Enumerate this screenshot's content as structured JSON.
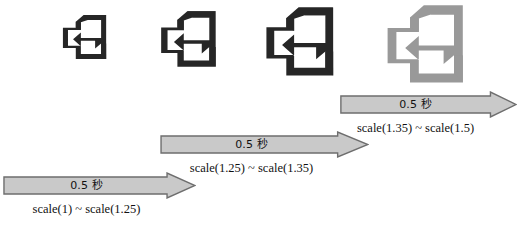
{
  "diagram": {
    "background_color": "#ffffff",
    "icon_color_default": "#262626",
    "icon_color_highlight": "#999999",
    "arrow_fill_color": "#c9c9c9",
    "arrow_stroke_color": "#6e6e6e",
    "text_color": "#111111"
  },
  "icons": [
    {
      "name": "exit-icon-step-1",
      "label": "exit-icon",
      "scale": "scale(1)",
      "color": "#262626",
      "x": 62,
      "y": 14,
      "size": 46
    },
    {
      "name": "exit-icon-step-2",
      "label": "exit-icon",
      "scale": "scale(1.25)",
      "color": "#262626",
      "x": 160,
      "y": 10,
      "size": 58
    },
    {
      "name": "exit-icon-step-3",
      "label": "exit-icon",
      "scale": "scale(1.35)",
      "color": "#262626",
      "x": 265,
      "y": 6,
      "size": 71
    },
    {
      "name": "exit-icon-step-4",
      "label": "exit-icon",
      "scale": "scale(1.5)",
      "color": "#999999",
      "x": 386,
      "y": 4,
      "size": 80
    }
  ],
  "arrows": [
    {
      "name": "timeline-arrow-1",
      "duration": "0.5 秒",
      "transition": "scale(1) ~ scale(1.25)",
      "x": 3,
      "y": 172,
      "width": 193,
      "height": 27
    },
    {
      "name": "timeline-arrow-2",
      "duration": "0.5 秒",
      "transition": "scale(1.25) ~ scale(1.35)",
      "x": 160,
      "y": 131,
      "width": 209,
      "height": 27
    },
    {
      "name": "timeline-arrow-3",
      "duration": "0.5 秒",
      "transition": "scale(1.35) ~ scale(1.5)",
      "x": 340,
      "y": 91,
      "width": 177,
      "height": 27
    }
  ]
}
